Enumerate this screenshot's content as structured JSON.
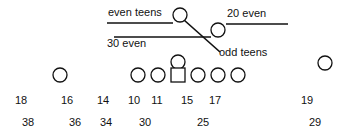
{
  "diagram": {
    "title": "",
    "stroke_color": "#111111",
    "background": "#ffffff",
    "route_labels": [
      {
        "id": "even-teens",
        "text": "even teens",
        "x": 108,
        "y": 16
      },
      {
        "id": "twenty-even",
        "text": "20 even",
        "x": 227,
        "y": 17
      },
      {
        "id": "thirty-even",
        "text": "30 even",
        "x": 107,
        "y": 47
      },
      {
        "id": "odd-teens",
        "text": "odd teens",
        "x": 219,
        "y": 56
      }
    ],
    "route_lines": [
      {
        "id": "even-teens-line",
        "x1": 107,
        "y1": 23,
        "x2": 173,
        "y2": 23
      },
      {
        "id": "thirty-even-line",
        "x1": 114,
        "y1": 37,
        "x2": 211,
        "y2": 37
      },
      {
        "id": "twenty-even-line",
        "x1": 226,
        "y1": 24,
        "x2": 288,
        "y2": 24
      },
      {
        "id": "odd-teens-line",
        "x1": 184,
        "y1": 20,
        "x2": 220,
        "y2": 52
      }
    ],
    "players": [
      {
        "id": "back-deep",
        "shape": "circle",
        "cx": 180,
        "cy": 15
      },
      {
        "id": "back-right",
        "shape": "circle",
        "cx": 218,
        "cy": 30
      },
      {
        "id": "quarterback",
        "shape": "circle",
        "cx": 178,
        "cy": 62
      },
      {
        "id": "wide-left",
        "shape": "circle",
        "cx": 60,
        "cy": 75
      },
      {
        "id": "line-1",
        "shape": "circle",
        "cx": 138,
        "cy": 75
      },
      {
        "id": "line-2",
        "shape": "circle",
        "cx": 158,
        "cy": 75
      },
      {
        "id": "center",
        "shape": "square",
        "cx": 178,
        "cy": 75
      },
      {
        "id": "line-4",
        "shape": "circle",
        "cx": 198,
        "cy": 75
      },
      {
        "id": "line-5",
        "shape": "circle",
        "cx": 218,
        "cy": 75
      },
      {
        "id": "line-6",
        "shape": "circle",
        "cx": 238,
        "cy": 75
      },
      {
        "id": "wide-right",
        "shape": "circle",
        "cx": 325,
        "cy": 63
      }
    ],
    "hole_numbers_row1": [
      {
        "text": "18",
        "x": 21,
        "y": 104
      },
      {
        "text": "16",
        "x": 67,
        "y": 104
      },
      {
        "text": "14",
        "x": 103,
        "y": 104
      },
      {
        "text": "10",
        "x": 134,
        "y": 104
      },
      {
        "text": "11",
        "x": 157,
        "y": 104
      },
      {
        "text": "15",
        "x": 187,
        "y": 104
      },
      {
        "text": "17",
        "x": 215,
        "y": 104
      },
      {
        "text": "19",
        "x": 307,
        "y": 104
      }
    ],
    "hole_numbers_row2": [
      {
        "text": "38",
        "x": 28,
        "y": 126
      },
      {
        "text": "36",
        "x": 75,
        "y": 126
      },
      {
        "text": "34",
        "x": 106,
        "y": 126
      },
      {
        "text": "30",
        "x": 145,
        "y": 126
      },
      {
        "text": "25",
        "x": 203,
        "y": 126
      },
      {
        "text": "29",
        "x": 315,
        "y": 126
      }
    ]
  }
}
